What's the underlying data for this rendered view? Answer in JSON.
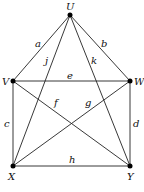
{
  "diagram": {
    "type": "graph",
    "nodes": [
      {
        "id": "U",
        "label": "U",
        "x": 70,
        "y": 15,
        "lx": 66,
        "ly": 10
      },
      {
        "id": "V",
        "label": "V",
        "x": 13,
        "y": 81,
        "lx": 2,
        "ly": 85
      },
      {
        "id": "W",
        "label": "W",
        "x": 130,
        "y": 81,
        "lx": 134,
        "ly": 85
      },
      {
        "id": "X",
        "label": "X",
        "x": 13,
        "y": 166,
        "lx": 8,
        "ly": 180
      },
      {
        "id": "Y",
        "label": "Y",
        "x": 130,
        "y": 166,
        "lx": 127,
        "ly": 180
      }
    ],
    "edges": [
      {
        "id": "a",
        "label": "a",
        "from": "U",
        "to": "V",
        "lx": 35,
        "ly": 47
      },
      {
        "id": "b",
        "label": "b",
        "from": "U",
        "to": "W",
        "lx": 101,
        "ly": 47
      },
      {
        "id": "j",
        "label": "j",
        "from": "U",
        "to": "X",
        "lx": 45,
        "ly": 64
      },
      {
        "id": "k",
        "label": "k",
        "from": "U",
        "to": "Y",
        "lx": 91,
        "ly": 64
      },
      {
        "id": "e",
        "label": "e",
        "from": "V",
        "to": "W",
        "lx": 67,
        "ly": 79
      },
      {
        "id": "c",
        "label": "c",
        "from": "V",
        "to": "X",
        "lx": 4,
        "ly": 127
      },
      {
        "id": "d",
        "label": "d",
        "from": "W",
        "to": "Y",
        "lx": 133,
        "ly": 127
      },
      {
        "id": "f",
        "label": "f",
        "from": "V",
        "to": "Y",
        "lx": 54,
        "ly": 106
      },
      {
        "id": "g",
        "label": "g",
        "from": "W",
        "to": "X",
        "lx": 85,
        "ly": 106
      },
      {
        "id": "h",
        "label": "h",
        "from": "X",
        "to": "Y",
        "lx": 69,
        "ly": 163
      }
    ]
  }
}
